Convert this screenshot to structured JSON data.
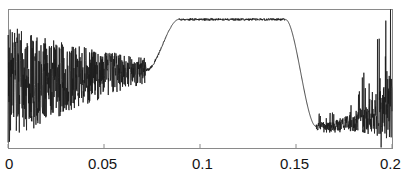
{
  "figure": {
    "background_color": "#ffffff",
    "frame_color": "#8a8a8a",
    "line_color": "#1a1a1a",
    "tick_label_color": "#141414"
  },
  "axes": {
    "plot_left_px": 8,
    "plot_top_px": 9,
    "plot_right_px": 392,
    "plot_bottom_px": 148
  },
  "chart_data": {
    "type": "line",
    "title": "",
    "xlabel": "",
    "ylabel": "",
    "xlim": [
      0,
      0.2
    ],
    "ylim": [
      0,
      1
    ],
    "grid": false,
    "legend": null,
    "xticks": [
      0,
      0.05,
      0.1,
      0.15,
      0.2
    ],
    "xticklabels": [
      "0",
      "0.05",
      "0.1",
      "0.15",
      "0.2"
    ],
    "yticks": [],
    "yticklabels": [],
    "series": [
      {
        "name": "signal",
        "color": "#1a1a1a",
        "linewidth": 0.8,
        "description": "Noisy low band, smooth rise to flat plateau between x=0.088 and x=0.145, steep fall, then rising-amplitude noise toward x=0.2",
        "envelope": {
          "left_noise_range_x": [
            0.0,
            0.072
          ],
          "left_noise_mean_start": 0.46,
          "left_noise_mean_end": 0.56,
          "left_noise_amplitude_start": 0.48,
          "left_noise_amplitude_end": 0.09,
          "rise_start_x": 0.072,
          "rise_end_x": 0.089,
          "plateau_start_x": 0.089,
          "plateau_end_x": 0.1445,
          "plateau_level": 0.925,
          "plateau_ripple": 0.008,
          "fall_start_x": 0.1445,
          "fall_end_x": 0.1605,
          "right_noise_range_x": [
            0.1605,
            0.2
          ],
          "right_noise_mean_start": 0.155,
          "right_noise_mean_end": 0.3,
          "right_noise_amplitude_start": 0.07,
          "right_noise_amplitude_end": 0.62
        }
      }
    ]
  },
  "x_tick_labels": [
    {
      "text": "0",
      "value": 0,
      "left_px": 5
    },
    {
      "text": "0.05",
      "value": 0.05,
      "left_px": 88
    },
    {
      "text": "0.1",
      "value": 0.1,
      "left_px": 192
    },
    {
      "text": "0.15",
      "value": 0.15,
      "left_px": 280
    },
    {
      "text": "0.2",
      "value": 0.2,
      "left_px": 380
    }
  ]
}
